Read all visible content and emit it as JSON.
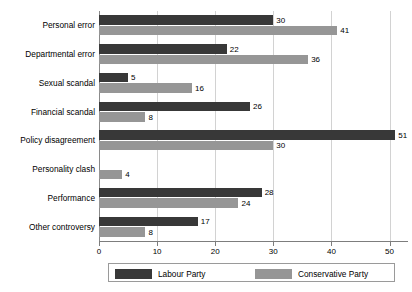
{
  "chart_data": {
    "type": "bar",
    "orientation": "horizontal",
    "title": "",
    "subtitle": "",
    "xlabel": "",
    "ylabel": "",
    "xlim": [
      0,
      53
    ],
    "ylim": null,
    "grid": "vertical",
    "legend_position": "bottom",
    "xticks": [
      "0",
      "10",
      "20",
      "30",
      "40",
      "50"
    ],
    "xtick_values": [
      0,
      10,
      20,
      30,
      40,
      50
    ],
    "categories": [
      "Personal error",
      "Departmental error",
      "Sexual scandal",
      "Financial scandal",
      "Policy disagreement",
      "Personality clash",
      "Performance",
      "Other controversy"
    ],
    "series": [
      {
        "name": "Labour Party",
        "color": "#383838",
        "values": [
          30,
          22,
          5,
          26,
          51,
          null,
          28,
          17
        ],
        "labels": [
          "30",
          "22",
          "5",
          "26",
          "51",
          "",
          "28",
          "17"
        ]
      },
      {
        "name": "Conservative Party",
        "color": "#969696",
        "values": [
          41,
          36,
          16,
          8,
          30,
          4,
          24,
          8
        ],
        "labels": [
          "41",
          "36",
          "16",
          "8",
          "30",
          "4",
          "24",
          "8"
        ]
      }
    ]
  },
  "legend": {
    "entries": [
      {
        "label": "Labour Party",
        "color": "#383838"
      },
      {
        "label": "Conservative Party",
        "color": "#969696"
      }
    ]
  },
  "colors": {
    "labour": "#383838",
    "conservative": "#969696",
    "gridline": "#d2d2d2",
    "axis": "#7d7d7d",
    "background": "#ffffff"
  }
}
